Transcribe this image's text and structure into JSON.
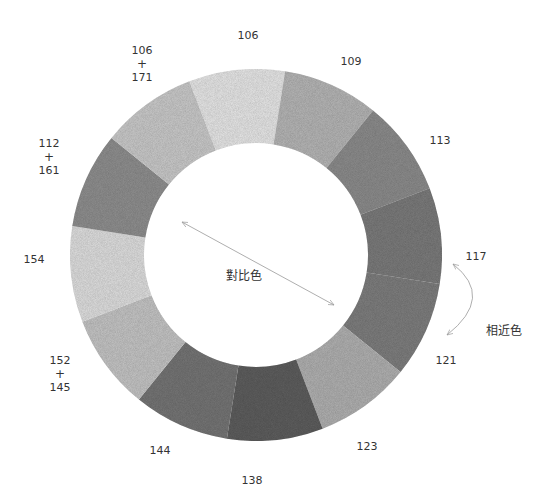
{
  "diagram": {
    "type": "color-wheel",
    "center": [
      256,
      255
    ],
    "outer_radius": 186,
    "inner_radius": 112,
    "segments": [
      {
        "label": "106",
        "shade": "#e6e6e6"
      },
      {
        "label": "109",
        "shade": "#b5b5b5"
      },
      {
        "label": "113",
        "shade": "#8c8c8c"
      },
      {
        "label": "117",
        "shade": "#7b7b7b"
      },
      {
        "label": "121",
        "shade": "#7e7e7e"
      },
      {
        "label": "123",
        "shade": "#b0b0b0"
      },
      {
        "label": "138",
        "shade": "#5e5e5e"
      },
      {
        "label": "144",
        "shade": "#757575"
      },
      {
        "label": "152+145",
        "shade": "#c4c4c4"
      },
      {
        "label": "154",
        "shade": "#dedede"
      },
      {
        "label": "112+161",
        "shade": "#8f8f8f"
      },
      {
        "label": "106+171",
        "shade": "#c9c9c9"
      }
    ],
    "labels": [
      {
        "lines": [
          "106"
        ],
        "x": 248,
        "y": 28
      },
      {
        "lines": [
          "109"
        ],
        "x": 351,
        "y": 54
      },
      {
        "lines": [
          "113"
        ],
        "x": 440,
        "y": 133
      },
      {
        "lines": [
          "117"
        ],
        "x": 476,
        "y": 249
      },
      {
        "lines": [
          "121"
        ],
        "x": 446,
        "y": 353
      },
      {
        "lines": [
          "123"
        ],
        "x": 367,
        "y": 439
      },
      {
        "lines": [
          "138"
        ],
        "x": 252,
        "y": 473
      },
      {
        "lines": [
          "144"
        ],
        "x": 160,
        "y": 443
      },
      {
        "lines": [
          "152",
          "+",
          "145"
        ],
        "x": 60,
        "y": 353
      },
      {
        "lines": [
          "154"
        ],
        "x": 34,
        "y": 252
      },
      {
        "lines": [
          "112",
          "+",
          "161"
        ],
        "x": 49,
        "y": 136
      },
      {
        "lines": [
          "106",
          "+",
          "171"
        ],
        "x": 142,
        "y": 43
      }
    ],
    "annotations": {
      "complementary": {
        "text": "對比色",
        "x": 226,
        "y": 266
      },
      "analogous": {
        "text": "相近色",
        "x": 486,
        "y": 321
      }
    },
    "colors": {
      "arrow": "#999999",
      "text": "#333333",
      "background": "#ffffff"
    }
  }
}
